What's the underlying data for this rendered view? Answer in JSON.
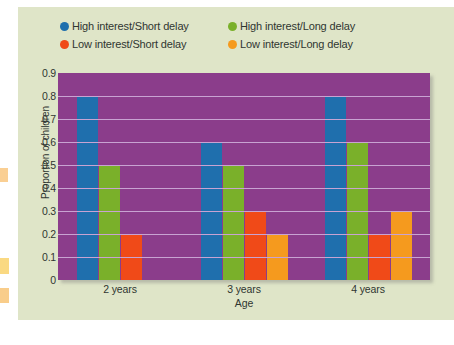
{
  "chart_data": {
    "type": "bar",
    "title": "",
    "xlabel": "Age",
    "ylabel": "Proportion of children",
    "categories": [
      "2 years",
      "3 years",
      "4 years"
    ],
    "ylim": [
      0,
      0.9
    ],
    "ytick_labels": [
      "0.9",
      "0.8",
      "0.7",
      "0.6",
      "0.5",
      "0.4",
      "0.3",
      "0.2",
      "0.1",
      "0"
    ],
    "ytick_values": [
      0.9,
      0.8,
      0.7,
      0.6,
      0.5,
      0.4,
      0.3,
      0.2,
      0.1,
      0
    ],
    "grid": true,
    "legend_position": "top",
    "plot_background": "#8b3d8b",
    "gridline_color": "#c8a3d2",
    "figure_background": "#dfe5c8",
    "series": [
      {
        "name": "High interest/Short delay",
        "color": "#1f6fad",
        "values": [
          0.8,
          0.6,
          0.8
        ]
      },
      {
        "name": "High interest/Long delay",
        "color": "#7ab02a",
        "values": [
          0.5,
          0.5,
          0.6
        ]
      },
      {
        "name": "Low interest/Short delay",
        "color": "#f04a18",
        "values": [
          0.2,
          0.3,
          0.2
        ]
      },
      {
        "name": "Low interest/Long delay",
        "color": "#f59a1e",
        "values": [
          0,
          0.2,
          0.3
        ]
      }
    ]
  }
}
